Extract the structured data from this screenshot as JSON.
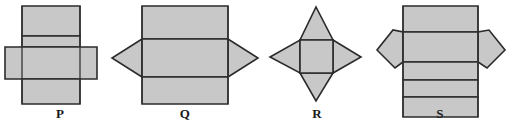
{
  "figure": {
    "background_color": "#ffffff",
    "fill_color": "#c8c8c8",
    "stroke_color": "#2b2b2b",
    "inner_stroke_color": "#333333",
    "stroke_width": 1.6
  },
  "nets": [
    {
      "id": "P",
      "label": "P",
      "description": "Net P: vertical column of three rectangles crossed by a horizontal bar",
      "parts": [
        {
          "name": "top-rectangle",
          "shape": "rect",
          "points": "22,6 80,6 80,36 22,36"
        },
        {
          "name": "upper-middle-rectangle",
          "shape": "rect",
          "points": "22,36 80,36 80,47 22,47"
        },
        {
          "name": "horizontal-bar",
          "shape": "rect",
          "points": "5,47 97,47 97,79 5,79"
        },
        {
          "name": "bottom-rectangle",
          "shape": "rect",
          "points": "22,79 80,79 80,104 22,104"
        }
      ]
    },
    {
      "id": "Q",
      "label": "Q",
      "description": "Net Q: large rectangle in three horizontal bands with triangular flaps left and right of the middle band",
      "parts": [
        {
          "name": "left-triangle-flap",
          "shape": "triangle",
          "points": "142,39 142,77 112,58"
        },
        {
          "name": "right-triangle-flap",
          "shape": "triangle",
          "points": "228,39 228,77 258,58"
        },
        {
          "name": "top-band",
          "shape": "rect",
          "points": "142,6 228,6 228,39 142,39"
        },
        {
          "name": "middle-band",
          "shape": "rect",
          "points": "142,39 228,39 228,77 142,77"
        },
        {
          "name": "bottom-band",
          "shape": "rect",
          "points": "142,77 228,77 228,104 142,104"
        }
      ]
    },
    {
      "id": "R",
      "label": "R",
      "description": "Net R: central square with a triangle on each of the four sides, forming a four pointed star",
      "parts": [
        {
          "name": "top-triangle",
          "shape": "triangle",
          "points": "300,40 333,40 316,7"
        },
        {
          "name": "bottom-triangle",
          "shape": "triangle",
          "points": "300,73 333,73 316,101"
        },
        {
          "name": "left-triangle",
          "shape": "triangle",
          "points": "300,40 300,73 270,57"
        },
        {
          "name": "right-triangle",
          "shape": "triangle",
          "points": "333,40 333,73 361,57"
        },
        {
          "name": "center-square",
          "shape": "rect",
          "points": "300,40 333,40 333,73 300,73"
        }
      ]
    },
    {
      "id": "S",
      "label": "S",
      "description": "Net S: tall rectangle divided into five horizontal bands with pentagonal flaps left and right of the second band",
      "parts": [
        {
          "name": "left-pentagon-flap",
          "shape": "pentagon",
          "points": "403,32 403,62 395,68 377,50 393,30"
        },
        {
          "name": "right-pentagon-flap",
          "shape": "pentagon",
          "points": "478,32 478,62 487,68 505,50 489,30"
        },
        {
          "name": "band-1",
          "shape": "rect",
          "points": "403,6 478,6 478,32 403,32"
        },
        {
          "name": "band-2",
          "shape": "rect",
          "points": "403,32 478,32 478,62 403,62"
        },
        {
          "name": "band-3",
          "shape": "rect",
          "points": "403,62 478,62 478,80 403,80"
        },
        {
          "name": "band-4",
          "shape": "rect",
          "points": "403,80 478,80 478,97 403,97"
        },
        {
          "name": "band-5",
          "shape": "rect",
          "points": "403,97 478,97 478,117 403,117"
        }
      ]
    }
  ]
}
